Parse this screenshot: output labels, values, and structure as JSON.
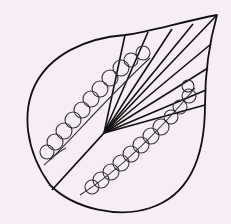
{
  "illustration": {
    "subject": "leaf line drawing",
    "background_color": "#f7eef5",
    "stroke_color": "#111111",
    "loop_stroke_color": "#333333",
    "elements": [
      "leaf-outline",
      "midrib",
      "fan-veins",
      "upper-loop-row",
      "lower-loop-row"
    ]
  }
}
